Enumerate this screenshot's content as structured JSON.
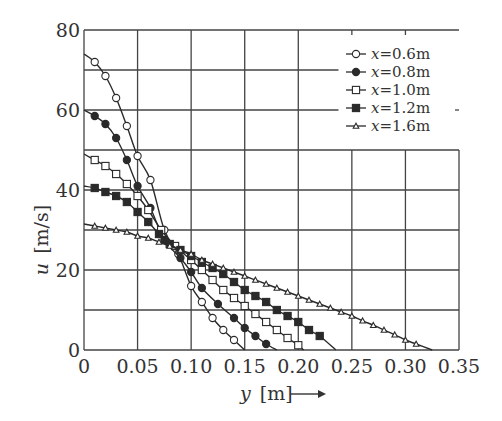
{
  "chart_data": {
    "type": "line",
    "title": "",
    "xlabel": "y [m] →",
    "xlabel_var": "y",
    "xlabel_unit": "[m]",
    "ylabel": "u [m/s]",
    "ylabel_var": "u",
    "ylabel_unit": "[m/s]",
    "xlim": [
      0,
      0.35
    ],
    "ylim": [
      0,
      80
    ],
    "xticks": [
      "0",
      "0.05",
      "0.10",
      "0.15",
      "0.20",
      "0.25",
      "0.30",
      "0.35"
    ],
    "xtick_values": [
      0,
      0.05,
      0.1,
      0.15,
      0.2,
      0.25,
      0.3,
      0.35
    ],
    "yticks": [
      "0",
      "20",
      "40",
      "60",
      "80"
    ],
    "ytick_values": [
      0,
      20,
      40,
      60,
      80
    ],
    "grid": true,
    "grid_y_step": 10,
    "grid_x_step": 0.05,
    "legend_position": "upper right",
    "series": [
      {
        "name": "x=0.6m",
        "label_var": "x",
        "label_value": "=0.6m",
        "marker": "open-circle",
        "x": [
          0,
          0.01,
          0.02,
          0.03,
          0.04,
          0.05,
          0.062,
          0.075,
          0.088,
          0.1,
          0.11,
          0.12,
          0.13,
          0.14,
          0.15
        ],
        "y": [
          74,
          72,
          68.5,
          63,
          56,
          48.5,
          42.5,
          30,
          24,
          16,
          12,
          8,
          5,
          2.5,
          0
        ],
        "markers_x": [
          0.01,
          0.02,
          0.03,
          0.04,
          0.05,
          0.062,
          0.075,
          0.088,
          0.1,
          0.11,
          0.12,
          0.13,
          0.14
        ],
        "markers_y": [
          72,
          68.5,
          63,
          56,
          48.5,
          42.5,
          30,
          24,
          16,
          12,
          8,
          5,
          2.5
        ]
      },
      {
        "name": "x=0.8m",
        "label_var": "x",
        "label_value": "=0.8m",
        "marker": "filled-circle",
        "x": [
          0,
          0.01,
          0.02,
          0.03,
          0.04,
          0.05,
          0.062,
          0.075,
          0.09,
          0.1,
          0.11,
          0.125,
          0.14,
          0.15,
          0.16,
          0.17,
          0.18
        ],
        "y": [
          60,
          58.5,
          56.5,
          53,
          47.5,
          41,
          35.5,
          27.5,
          23,
          19.5,
          15.5,
          11.5,
          8,
          5.5,
          3.5,
          1.5,
          0
        ],
        "markers_x": [
          0.01,
          0.02,
          0.03,
          0.04,
          0.05,
          0.062,
          0.075,
          0.09,
          0.1,
          0.11,
          0.125,
          0.14,
          0.15,
          0.16,
          0.17
        ],
        "markers_y": [
          58.5,
          56.5,
          53,
          47.5,
          41,
          35.5,
          27.5,
          23,
          19.5,
          15.5,
          11.5,
          8,
          5.5,
          3.5,
          1.5
        ]
      },
      {
        "name": "x=1.0m",
        "label_var": "x",
        "label_value": "=1.0m",
        "marker": "open-square",
        "x": [
          0,
          0.01,
          0.02,
          0.03,
          0.04,
          0.05,
          0.06,
          0.072,
          0.085,
          0.1,
          0.11,
          0.12,
          0.13,
          0.14,
          0.15,
          0.16,
          0.17,
          0.18,
          0.19,
          0.2,
          0.205
        ],
        "y": [
          49,
          47.5,
          46,
          44,
          41.5,
          38.5,
          35,
          30,
          26,
          22.5,
          20,
          17.5,
          15,
          13,
          11,
          9,
          7,
          5,
          3,
          1.2,
          0
        ],
        "markers_x": [
          0.01,
          0.02,
          0.03,
          0.04,
          0.05,
          0.06,
          0.072,
          0.085,
          0.1,
          0.11,
          0.12,
          0.13,
          0.14,
          0.15,
          0.16,
          0.17,
          0.18,
          0.19,
          0.2
        ],
        "markers_y": [
          47.5,
          46,
          44,
          41.5,
          38.5,
          35,
          30,
          26,
          22.5,
          20,
          17.5,
          15,
          13,
          11,
          9,
          7,
          5,
          3,
          1.2
        ]
      },
      {
        "name": "x=1.2m",
        "label_var": "x",
        "label_value": "=1.2m",
        "marker": "filled-square",
        "x": [
          0,
          0.01,
          0.02,
          0.03,
          0.04,
          0.05,
          0.06,
          0.07,
          0.08,
          0.09,
          0.1,
          0.11,
          0.12,
          0.13,
          0.14,
          0.15,
          0.16,
          0.17,
          0.18,
          0.19,
          0.2,
          0.21,
          0.22,
          0.235
        ],
        "y": [
          41,
          40.5,
          39.5,
          38.5,
          37,
          34.5,
          32,
          29,
          26.5,
          25,
          23.5,
          22,
          20.5,
          19,
          17,
          15,
          13.5,
          12,
          10,
          8.5,
          7,
          5,
          3.5,
          0
        ],
        "markers_x": [
          0.01,
          0.02,
          0.03,
          0.04,
          0.05,
          0.06,
          0.07,
          0.08,
          0.09,
          0.1,
          0.11,
          0.12,
          0.13,
          0.14,
          0.15,
          0.16,
          0.17,
          0.18,
          0.19,
          0.2,
          0.21,
          0.22
        ],
        "markers_y": [
          40.5,
          39.5,
          38.5,
          37,
          34.5,
          32,
          29,
          26.5,
          25,
          23.5,
          22,
          20.5,
          19,
          17,
          15,
          13.5,
          12,
          10,
          8.5,
          7,
          5,
          3.5
        ]
      },
      {
        "name": "x=1.6m",
        "label_var": "x",
        "label_value": "=1.6m",
        "marker": "open-triangle",
        "x": [
          0,
          0.01,
          0.02,
          0.03,
          0.04,
          0.05,
          0.06,
          0.07,
          0.08,
          0.09,
          0.1,
          0.11,
          0.12,
          0.13,
          0.14,
          0.15,
          0.16,
          0.17,
          0.18,
          0.19,
          0.2,
          0.21,
          0.22,
          0.23,
          0.24,
          0.25,
          0.26,
          0.27,
          0.28,
          0.29,
          0.3,
          0.31,
          0.325
        ],
        "y": [
          31.5,
          31,
          30.5,
          30,
          29.5,
          28.5,
          28,
          27,
          26,
          25,
          24,
          22.5,
          21.5,
          20.5,
          19.5,
          18.5,
          17.5,
          16.5,
          15.5,
          14.5,
          13.5,
          12.5,
          11.5,
          10.5,
          9.5,
          8.5,
          7.3,
          6.2,
          5,
          3.8,
          2.5,
          1.5,
          0
        ],
        "markers_x": [
          0.01,
          0.02,
          0.03,
          0.04,
          0.05,
          0.06,
          0.07,
          0.08,
          0.09,
          0.1,
          0.11,
          0.12,
          0.13,
          0.14,
          0.15,
          0.16,
          0.17,
          0.18,
          0.19,
          0.2,
          0.21,
          0.22,
          0.23,
          0.24,
          0.25,
          0.26,
          0.27,
          0.28,
          0.29,
          0.3,
          0.31
        ],
        "markers_y": [
          31,
          30.5,
          30,
          29.5,
          28.5,
          28,
          27,
          26,
          25,
          24,
          22.5,
          21.5,
          20.5,
          19.5,
          18.5,
          17.5,
          16.5,
          15.5,
          14.5,
          13.5,
          12.5,
          11.5,
          10.5,
          9.5,
          8.5,
          7.3,
          6.2,
          5,
          3.8,
          2.5,
          1.5
        ]
      }
    ]
  },
  "colors": {
    "ink": "#2a2a2a",
    "grid": "#444444",
    "background": "#ffffff"
  }
}
